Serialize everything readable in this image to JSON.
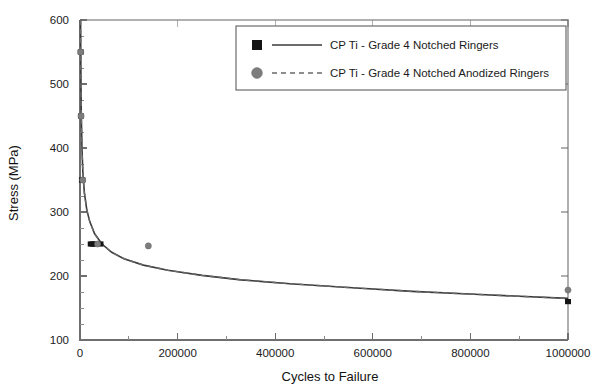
{
  "chart_data": {
    "type": "scatter",
    "title": "",
    "xlabel": "Cycles to Failure",
    "ylabel": "Stress (MPa)",
    "xlim": [
      0,
      1000000
    ],
    "ylim": [
      100,
      600
    ],
    "xticks": [
      0,
      200000,
      400000,
      600000,
      800000,
      1000000
    ],
    "xtick_labels": [
      "0",
      "200000",
      "400000",
      "600000",
      "800000",
      "1000000"
    ],
    "yticks": [
      100,
      200,
      300,
      400,
      500,
      600
    ],
    "ytick_labels": [
      "100",
      "200",
      "300",
      "400",
      "500",
      "600"
    ],
    "x_minor_step": 100000,
    "y_minor_step": 25,
    "grid": false,
    "legend_position": "top-right",
    "series": [
      {
        "name": "CP Ti - Grade 4 Notched Ringers",
        "marker": "square",
        "marker_color": "#141414",
        "line_style": "solid",
        "line_color": "#3a3a3a",
        "points": [
          {
            "x": 1500,
            "y": 550
          },
          {
            "x": 2000,
            "y": 450
          },
          {
            "x": 4000,
            "y": 350
          },
          {
            "x": 5000,
            "y": 350
          },
          {
            "x": 22000,
            "y": 250
          },
          {
            "x": 26000,
            "y": 250
          },
          {
            "x": 30000,
            "y": 250
          },
          {
            "x": 42000,
            "y": 250
          },
          {
            "x": 1000000,
            "y": 160
          }
        ]
      },
      {
        "name": "CP Ti - Grade 4 Notched Anodized Ringers",
        "marker": "circle",
        "marker_color": "#7d7d7d",
        "line_style": "dashed",
        "line_color": "#6a6a6a",
        "points": [
          {
            "x": 1500,
            "y": 550
          },
          {
            "x": 2200,
            "y": 450
          },
          {
            "x": 5500,
            "y": 350
          },
          {
            "x": 36000,
            "y": 250
          },
          {
            "x": 140000,
            "y": 247
          },
          {
            "x": 1000000,
            "y": 178
          }
        ]
      }
    ],
    "fit_curve": {
      "description": "Power-law S-N fit overlaying both series",
      "points": [
        {
          "x": 1200,
          "y": 600
        },
        {
          "x": 1800,
          "y": 520
        },
        {
          "x": 2600,
          "y": 455
        },
        {
          "x": 4000,
          "y": 400
        },
        {
          "x": 6000,
          "y": 360
        },
        {
          "x": 9000,
          "y": 330
        },
        {
          "x": 14000,
          "y": 303
        },
        {
          "x": 20000,
          "y": 285
        },
        {
          "x": 30000,
          "y": 266
        },
        {
          "x": 45000,
          "y": 250
        },
        {
          "x": 65000,
          "y": 237
        },
        {
          "x": 90000,
          "y": 227
        },
        {
          "x": 130000,
          "y": 217
        },
        {
          "x": 180000,
          "y": 209
        },
        {
          "x": 250000,
          "y": 201
        },
        {
          "x": 330000,
          "y": 194
        },
        {
          "x": 430000,
          "y": 188
        },
        {
          "x": 550000,
          "y": 182
        },
        {
          "x": 680000,
          "y": 176
        },
        {
          "x": 820000,
          "y": 171
        },
        {
          "x": 1000000,
          "y": 165
        }
      ]
    }
  },
  "legend": {
    "entries": [
      {
        "label": "CP Ti - Grade 4 Notched Ringers",
        "marker": "filled-square",
        "line": "solid"
      },
      {
        "label": "CP Ti - Grade 4 Notched Anodized Ringers",
        "marker": "filled-circle",
        "line": "dashed"
      }
    ]
  },
  "colors": {
    "axis": "#6f6f6f",
    "text": "#1b1b1b",
    "series1": "#141414",
    "series2": "#7d7d7d",
    "background": "#ffffff"
  }
}
